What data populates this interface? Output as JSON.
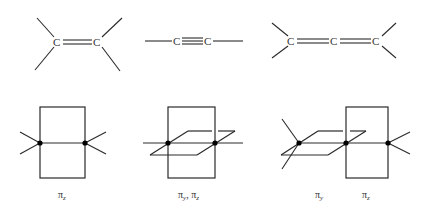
{
  "top_row": {
    "ethylene": {
      "atoms": [
        "C",
        "C"
      ],
      "bond": "double"
    },
    "acetylene": {
      "atoms": [
        "C",
        "C"
      ],
      "bond": "triple"
    },
    "allene": {
      "atoms": [
        "C",
        "C",
        "C"
      ],
      "bonds": [
        "double",
        "double"
      ]
    }
  },
  "bottom_row": {
    "panel1": {
      "labels": [
        {
          "symbol": "π",
          "sub": "z"
        }
      ]
    },
    "panel2": {
      "label_text": "π",
      "sub1": "y",
      "sep": ", ",
      "label_text2": "π",
      "sub2": "z"
    },
    "panel3": {
      "labels": [
        {
          "symbol": "π",
          "sub": "y"
        },
        {
          "symbol": "π",
          "sub": "z"
        }
      ]
    }
  }
}
